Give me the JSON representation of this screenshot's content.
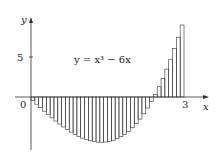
{
  "chart_data": {
    "type": "bar",
    "title": "",
    "function_label": "y = x³ − 6x",
    "function": "x^3 - 6x",
    "xlabel": "x",
    "ylabel": "y",
    "x_ticks": [
      {
        "value": 0,
        "label": "0"
      },
      {
        "value": 3,
        "label": "3"
      }
    ],
    "y_ticks": [
      {
        "value": 5,
        "label": "5"
      }
    ],
    "xlim": [
      -0.5,
      3.6
    ],
    "ylim": [
      -6.5,
      10.5
    ],
    "interval": [
      0,
      3
    ],
    "n_rectangles": 40,
    "sample_point": "right endpoint",
    "grid": false,
    "legend": null,
    "colors": {
      "stroke": "#333333",
      "background": "#ffffff"
    }
  }
}
